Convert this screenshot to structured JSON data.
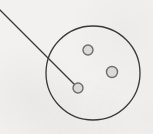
{
  "figure": {
    "background_color": "#f2f1ef",
    "ink_color": "#3a3a3a",
    "node_stroke_color": "#6e6e6e",
    "node_fill_color": "#dedbd8",
    "label": {
      "text": "es",
      "note": "truncated label fragment at top-left edge"
    },
    "leader_line": {
      "from_x": 0,
      "from_y": 10,
      "to_x": 78,
      "to_y": 88
    },
    "outer_circle": {
      "cx": 93,
      "cy": 73,
      "r": 47,
      "stroke_width": 1.3
    },
    "nodes": [
      {
        "name": "node-upper",
        "cx": 88,
        "cy": 50,
        "r": 5
      },
      {
        "name": "node-right",
        "cx": 112,
        "cy": 72,
        "r": 5.5
      },
      {
        "name": "node-lower-left",
        "cx": 78,
        "cy": 88,
        "r": 5
      }
    ]
  }
}
